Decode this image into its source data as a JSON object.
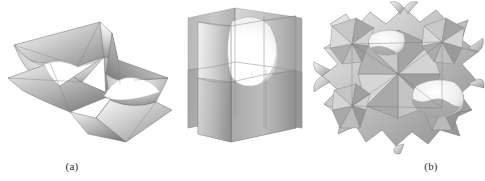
{
  "figure": {
    "background_color": "#ffffff",
    "ink_color": "#2b2b2b",
    "width": 485,
    "height": 181,
    "panel_count": 3,
    "panels": [
      {
        "id": "a",
        "label": "(a)",
        "subject": "doubly-periodic Scherk minimal surface fragment",
        "description": "Two interleaved saddle sheets, each a flat quadrilateral wing pierced by a curved catenoidal neck; rendered in grayscale with smooth shading.",
        "palette": {
          "highlight": "#fdfdfd",
          "light": "#e2e2e2",
          "mid": "#b4b4b4",
          "shadow": "#8a8a8a",
          "dark": "#6a6a6a",
          "outline": "#555555"
        }
      },
      {
        "id": "b",
        "label": "(b)",
        "subject": "Scherk surface saddle tower unit cell",
        "description": "Two near-vertical intersecting planar sheets meeting along a vertical line, with a large bright elliptical tunnel opening through the upper half.",
        "palette": {
          "highlight": "#ffffff",
          "light": "#dcdcdc",
          "mid": "#b0b0b0",
          "shadow": "#8f8f8f",
          "dark": "#707070",
          "outline": "#5a5a5a"
        }
      },
      {
        "id": "c",
        "label": "(c)",
        "subject": "triply periodic minimal surface (Schwarz-type) unit block",
        "description": "A cube-like assembly of faceted radial fans meeting at star-shaped vertex points, with curved catenoidal tunnels opening on the faces and flared lobes projecting from the corners.",
        "palette": {
          "highlight": "#fbfbfb",
          "light": "#dadada",
          "mid": "#acacac",
          "shadow": "#878787",
          "dark": "#676767",
          "outline": "#505050"
        }
      }
    ]
  }
}
